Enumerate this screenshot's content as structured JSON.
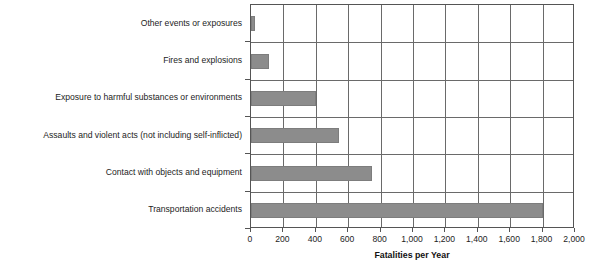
{
  "chart_data": {
    "type": "bar",
    "orientation": "horizontal",
    "title": "",
    "xlabel": "Fatalities per Year",
    "ylabel": "",
    "xlim": [
      0,
      2000
    ],
    "xticks": [
      "0",
      "200",
      "400",
      "600",
      "800",
      "1,000",
      "1,200",
      "1,400",
      "1,600",
      "1,800",
      "2,000"
    ],
    "xtick_values": [
      0,
      200,
      400,
      600,
      800,
      1000,
      1200,
      1400,
      1600,
      1800,
      2000
    ],
    "grid": "vertical-and-horizontal",
    "legend": "none",
    "bar_color": "#8c8c8c",
    "categories": [
      "Other events or exposures",
      "Fires and explosions",
      "Exposure to harmful substances or environments",
      "Assaults and violent acts (not including self-inflicted)",
      "Contact with objects and equipment",
      "Transportation accidents"
    ],
    "values": [
      25,
      110,
      400,
      545,
      745,
      1800
    ]
  }
}
